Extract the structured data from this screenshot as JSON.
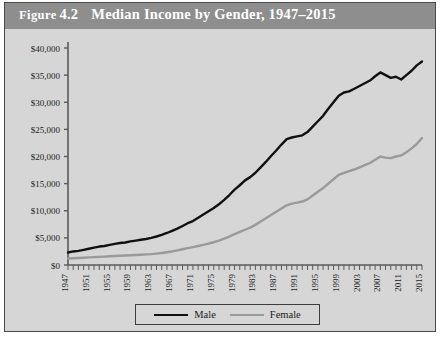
{
  "figure": {
    "label": "Figure",
    "number": "4.2",
    "title": "Median Income by Gender, 1947–2015",
    "panel_color": "#d6d6d6",
    "titlebar_color": "#8e8e8e",
    "border_color": "#4a4a4a"
  },
  "legend": {
    "position": "bottom-center",
    "items": [
      {
        "label": "Male",
        "color": "#111111"
      },
      {
        "label": "Female",
        "color": "#9a9a9a"
      }
    ]
  },
  "axis": {
    "y_ticks": [
      "$0",
      "$5,000",
      "$10,000",
      "$15,000",
      "$20,000",
      "$25,000",
      "$30,000",
      "$35,000",
      "$40,000"
    ],
    "x_ticks": [
      "1947",
      "1951",
      "1955",
      "1959",
      "1963",
      "1967",
      "1971",
      "1975",
      "1979",
      "1983",
      "1987",
      "1991",
      "1995",
      "1999",
      "2003",
      "2007",
      "2011",
      "2015"
    ]
  },
  "chart_data": {
    "type": "line",
    "title": "Median Income by Gender, 1947–2015",
    "xlabel": "",
    "ylabel": "",
    "ylim": [
      0,
      40000
    ],
    "xlim": [
      1947,
      2015
    ],
    "ytick_step": 5000,
    "xtick_step": 4,
    "grid": false,
    "legend": [
      "Male",
      "Female"
    ],
    "x": [
      1947,
      1948,
      1949,
      1950,
      1951,
      1952,
      1953,
      1954,
      1955,
      1956,
      1957,
      1958,
      1959,
      1960,
      1961,
      1962,
      1963,
      1964,
      1965,
      1966,
      1967,
      1968,
      1969,
      1970,
      1971,
      1972,
      1973,
      1974,
      1975,
      1976,
      1977,
      1978,
      1979,
      1980,
      1981,
      1982,
      1983,
      1984,
      1985,
      1986,
      1987,
      1988,
      1989,
      1990,
      1991,
      1992,
      1993,
      1994,
      1995,
      1996,
      1997,
      1998,
      1999,
      2000,
      2001,
      2002,
      2003,
      2004,
      2005,
      2006,
      2007,
      2008,
      2009,
      2010,
      2011,
      2012,
      2013,
      2014,
      2015
    ],
    "series": [
      {
        "name": "Male",
        "color": "#111111",
        "values": [
          2300,
          2500,
          2600,
          2800,
          3000,
          3200,
          3400,
          3500,
          3700,
          3900,
          4050,
          4150,
          4350,
          4500,
          4650,
          4800,
          5000,
          5250,
          5550,
          5900,
          6300,
          6700,
          7200,
          7700,
          8100,
          8700,
          9300,
          9900,
          10500,
          11200,
          12000,
          12900,
          13900,
          14700,
          15600,
          16200,
          17000,
          18000,
          19000,
          20100,
          21100,
          22200,
          23200,
          23500,
          23700,
          23900,
          24500,
          25500,
          26500,
          27500,
          28800,
          30000,
          31200,
          31800,
          32000,
          32500,
          33000,
          33500,
          34000,
          34800,
          35500,
          35000,
          34500,
          34700,
          34200,
          35000,
          35800,
          36800,
          37500
        ]
      },
      {
        "name": "Female",
        "color": "#9a9a9a",
        "values": [
          1200,
          1250,
          1300,
          1350,
          1400,
          1450,
          1500,
          1550,
          1600,
          1650,
          1700,
          1750,
          1800,
          1850,
          1900,
          1950,
          2000,
          2100,
          2200,
          2350,
          2500,
          2700,
          2900,
          3100,
          3300,
          3500,
          3700,
          3950,
          4200,
          4500,
          4850,
          5250,
          5700,
          6100,
          6500,
          6900,
          7400,
          8000,
          8600,
          9200,
          9800,
          10400,
          11000,
          11300,
          11500,
          11700,
          12100,
          12800,
          13500,
          14200,
          15000,
          15800,
          16600,
          17000,
          17300,
          17600,
          18000,
          18400,
          18800,
          19400,
          20000,
          19800,
          19700,
          20000,
          20200,
          20800,
          21500,
          22300,
          23400
        ]
      }
    ]
  }
}
